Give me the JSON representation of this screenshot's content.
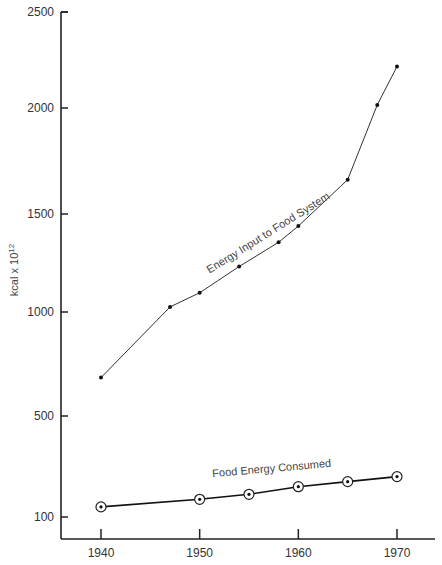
{
  "chart_data": {
    "type": "line",
    "title": "",
    "xlabel": "",
    "ylabel": "kcal x 10¹²",
    "ylabel_base": "kcal x 10",
    "ylabel_exp": "12",
    "xlim": [
      1937,
      1974
    ],
    "ylim": [
      0,
      2500
    ],
    "x_ticks": [
      1940,
      1950,
      1960,
      1970
    ],
    "x_tick_labels": [
      "1940",
      "1950",
      "1960",
      "1970"
    ],
    "y_ticks": [
      100,
      500,
      1000,
      1500,
      2000,
      2500
    ],
    "y_tick_labels": [
      "100",
      "500",
      "1000",
      "1500",
      "2000",
      "2500"
    ],
    "grid": false,
    "legend": "none (series labeled inline)",
    "series": [
      {
        "name": "Energy Input to Food System",
        "label": "Energy Input  to Food System",
        "marker": "dot",
        "x": [
          1940,
          1947,
          1950,
          1954,
          1958,
          1960,
          1965,
          1968,
          1970
        ],
        "values": [
          690,
          1040,
          1110,
          1240,
          1360,
          1440,
          1670,
          2040,
          2230
        ]
      },
      {
        "name": "Food Energy Consumed",
        "label": "Food Energy Consumed",
        "marker": "circled-dot",
        "x": [
          1940,
          1950,
          1955,
          1960,
          1965,
          1970
        ],
        "values": [
          140,
          170,
          190,
          220,
          240,
          260
        ]
      }
    ]
  }
}
